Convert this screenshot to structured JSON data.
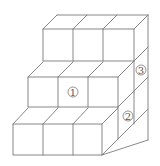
{
  "diagram": {
    "type": "isometric-cube-stack",
    "line_color": "#7a7a7a",
    "labels": [
      {
        "id": "1",
        "text": "①",
        "x": 73,
        "y": 93
      },
      {
        "id": "2",
        "text": "②",
        "x": 128,
        "y": 117
      },
      {
        "id": "3",
        "text": "③",
        "x": 141,
        "y": 71
      }
    ]
  }
}
